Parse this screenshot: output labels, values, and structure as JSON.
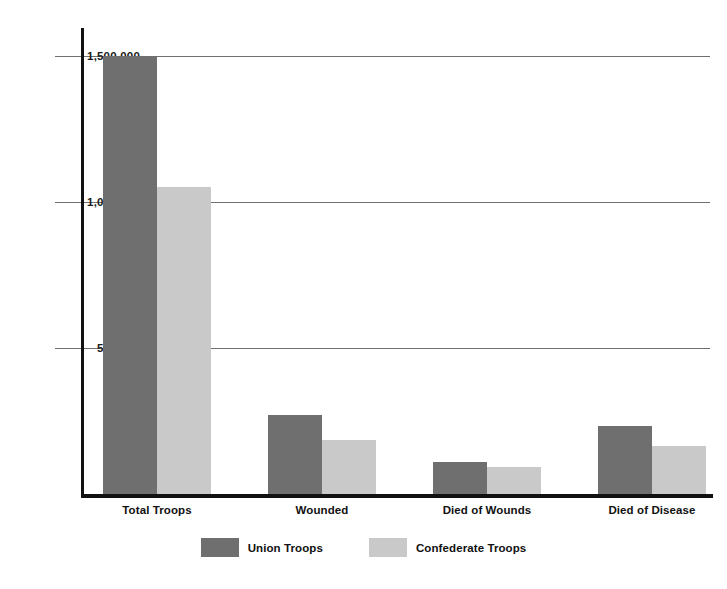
{
  "chart_data": {
    "type": "bar",
    "title": "",
    "xlabel": "",
    "ylabel": "",
    "categories": [
      "Total Troops",
      "Wounded",
      "Died of Wounds",
      "Died of Disease"
    ],
    "series": [
      {
        "name": "Union Troops",
        "color": "#6f6f6f",
        "values": [
          1500000,
          271000,
          110000,
          233000
        ]
      },
      {
        "name": "Confederate Troops",
        "color": "#c9c9c9",
        "values": [
          1050000,
          185000,
          94000,
          164000
        ]
      }
    ],
    "ylim": [
      0,
      1650000
    ],
    "yticks": [
      500000,
      1000000,
      1500000
    ],
    "ytick_labels": [
      "500,000",
      "1,000,000",
      "1,500,000"
    ],
    "grid": true,
    "legend_position": "bottom"
  },
  "axis": {
    "ticks": [
      {
        "label": "1,500,000",
        "value": 1500000
      },
      {
        "label": "1,000,000",
        "value": 1000000
      },
      {
        "label": "500,000",
        "value": 500000
      }
    ]
  },
  "legend": {
    "entries": [
      {
        "label": "Union Troops",
        "color": "#6f6f6f"
      },
      {
        "label": "Confederate Troops",
        "color": "#c9c9c9"
      }
    ]
  }
}
